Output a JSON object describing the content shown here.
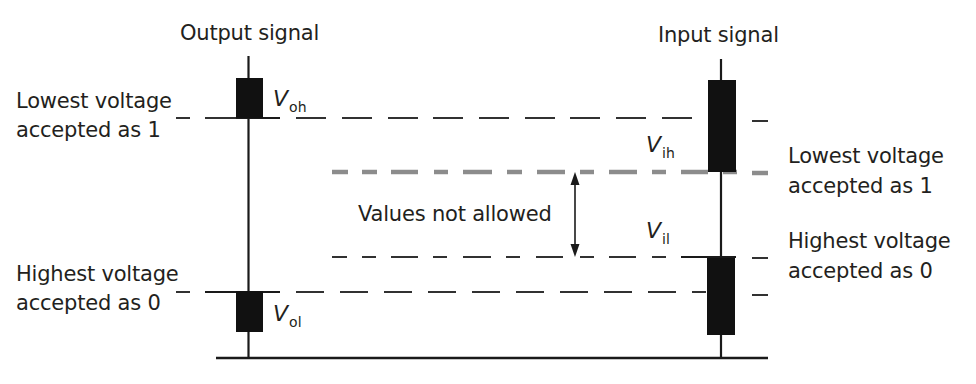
{
  "diagram": {
    "type": "logic-level voltage thresholds",
    "output_side": {
      "title": "Output signal",
      "high_symbol": {
        "base": "V",
        "subscript": "oh"
      },
      "low_symbol": {
        "base": "V",
        "subscript": "ol"
      },
      "high_label": {
        "line1": "Lowest voltage",
        "line2": "accepted as 1"
      },
      "low_label": {
        "line1": "Highest voltage",
        "line2": "accepted as 0"
      }
    },
    "input_side": {
      "title": "Input signal",
      "high_symbol": {
        "base": "V",
        "subscript": "ih"
      },
      "low_symbol": {
        "base": "V",
        "subscript": "il"
      },
      "high_label": {
        "line1": "Lowest voltage",
        "line2": "accepted as 1"
      },
      "low_label": {
        "line1": "Highest voltage",
        "line2": "accepted as 0"
      }
    },
    "forbidden_region": {
      "label": "Values not allowed"
    },
    "colors": {
      "ink": "#1a1a1a",
      "highlight_dash": "#8c8c8c",
      "background": "#ffffff"
    }
  }
}
